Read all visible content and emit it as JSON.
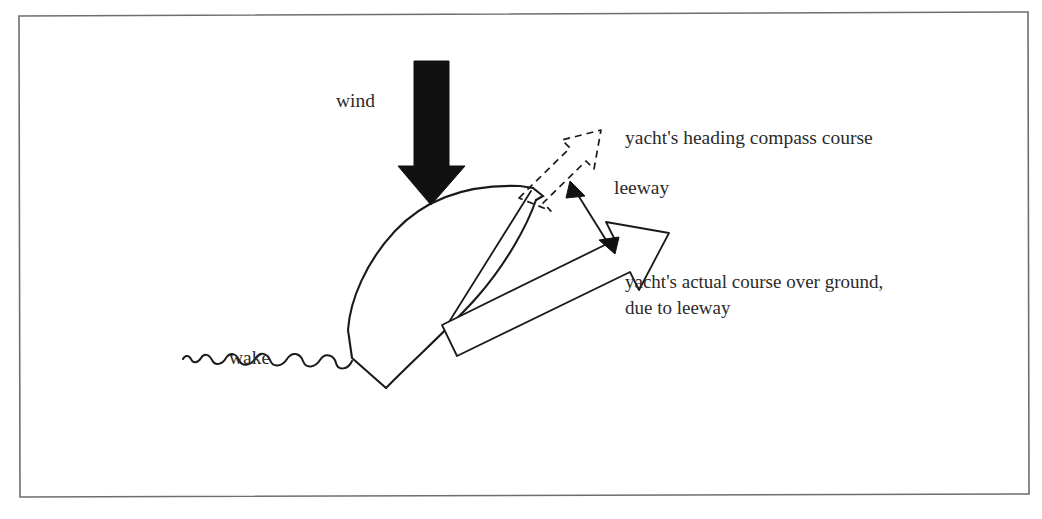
{
  "figure": {
    "kind": "nautical-leeway-diagram",
    "background_color": "#ffffff",
    "border_color": "#6e6e6e",
    "ink_color": "#1a1a1a",
    "text_color": "#2b2b2b"
  },
  "labels": {
    "wind": "wind",
    "wake": "wake",
    "heading": "yacht's heading compass course",
    "leeway": "leeway",
    "actual_course_line1": "yacht's actual course over ground,",
    "actual_course_line2": "due to leeway"
  },
  "elements": {
    "wind_arrow": {
      "name": "wind-arrow",
      "style": "solid-black",
      "direction": "down"
    },
    "heading_arrow": {
      "name": "heading-arrow",
      "style": "dashed-outline",
      "direction": "up-right"
    },
    "course_arrow": {
      "name": "course-arrow",
      "style": "white-outline",
      "direction": "up-right"
    },
    "leeway_arrow": {
      "name": "leeway-arrow",
      "style": "double-headed",
      "direction": "between-heading-and-course"
    },
    "hull": {
      "name": "yacht-hull",
      "style": "outline",
      "heading": "up-right"
    },
    "wake_line": {
      "name": "wake-squiggle",
      "style": "sinusoid",
      "direction": "down-left-from-stern"
    }
  }
}
